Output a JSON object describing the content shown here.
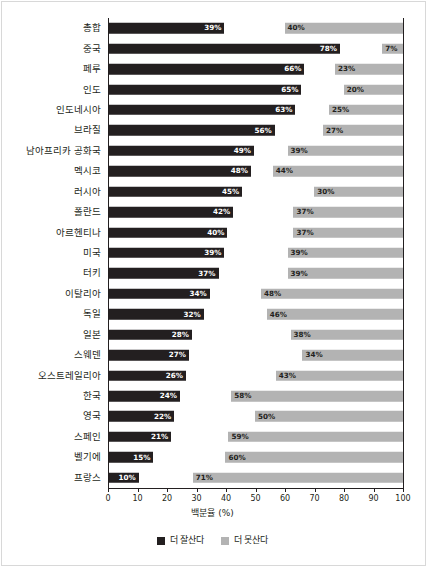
{
  "chart_data": {
    "type": "bar",
    "orientation": "horizontal",
    "title": "",
    "xlabel": "백분율 (%)",
    "ylabel": "",
    "xlim": [
      0,
      100
    ],
    "xticks": [
      0,
      10,
      20,
      30,
      40,
      50,
      60,
      70,
      80,
      90,
      100
    ],
    "xtick_labels": [
      "0",
      "10",
      "20",
      "30",
      "40",
      "50",
      "60",
      "70",
      "80",
      "90",
      "100"
    ],
    "grid": false,
    "legend_position": "bottom-center",
    "categories": [
      "총합",
      "중국",
      "페루",
      "인도",
      "인도네시아",
      "브라질",
      "남아프리카 공화국",
      "멕시코",
      "러시아",
      "폴란드",
      "아르헨티나",
      "미국",
      "터키",
      "이탈리아",
      "독일",
      "일본",
      "스웨덴",
      "오스트레일리아",
      "한국",
      "영국",
      "스페인",
      "벨기에",
      "프랑스"
    ],
    "series": [
      {
        "name": "더 잘산다",
        "color": "#231f20",
        "anchor": "left",
        "values": [
          39,
          78,
          66,
          65,
          63,
          56,
          49,
          48,
          45,
          42,
          40,
          39,
          37,
          34,
          32,
          28,
          27,
          26,
          24,
          22,
          21,
          15,
          10
        ],
        "labels": [
          "39%",
          "78%",
          "66%",
          "65%",
          "63%",
          "56%",
          "49%",
          "48%",
          "45%",
          "42%",
          "40%",
          "39%",
          "37%",
          "34%",
          "32%",
          "28%",
          "27%",
          "26%",
          "24%",
          "22%",
          "21%",
          "15%",
          "10%"
        ]
      },
      {
        "name": "더 못산다",
        "color": "#b3b3b3",
        "anchor": "right",
        "values": [
          40,
          7,
          23,
          20,
          25,
          27,
          39,
          44,
          30,
          37,
          37,
          39,
          39,
          48,
          46,
          38,
          34,
          43,
          58,
          50,
          59,
          60,
          71
        ],
        "labels": [
          "40%",
          "7%",
          "23%",
          "20%",
          "25%",
          "27%",
          "39%",
          "44%",
          "30%",
          "37%",
          "37%",
          "39%",
          "39%",
          "48%",
          "46%",
          "38%",
          "34%",
          "43%",
          "58%",
          "50%",
          "59%",
          "60%",
          "71%"
        ]
      }
    ]
  },
  "legend": {
    "items": [
      {
        "label": "더 잘산다",
        "swatch": "dark"
      },
      {
        "label": "더 못산다",
        "swatch": "gray"
      }
    ]
  },
  "axis": {
    "x_title": "백분율 (%)"
  },
  "clipped_title": {
    "text": ""
  }
}
